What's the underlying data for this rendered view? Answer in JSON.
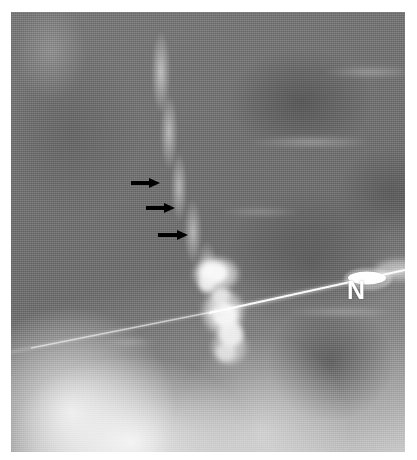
{
  "figure": {
    "kind": "radiograph",
    "modality_label": "fluoroscopic-spot-radiograph",
    "background_color": "#ffffff",
    "plate": {
      "x": 11,
      "y": 12,
      "width": 394,
      "height": 440,
      "base_color": "#6e6e6e"
    }
  },
  "annotations": {
    "arrows": [
      {
        "id": "arrow-1",
        "label": "",
        "x": 131,
        "y": 178,
        "length": 29,
        "color": "#000000",
        "direction": "right"
      },
      {
        "id": "arrow-2",
        "label": "",
        "x": 146,
        "y": 203,
        "length": 29,
        "color": "#000000",
        "direction": "right"
      },
      {
        "id": "arrow-3",
        "label": "",
        "x": 158,
        "y": 230,
        "length": 30,
        "color": "#000000",
        "direction": "right"
      }
    ],
    "letter_labels": [
      {
        "id": "needle-label",
        "text": "N",
        "x": 347,
        "y": 278,
        "color": "#ffffff",
        "font_size": 25
      }
    ]
  },
  "radiographic_features": {
    "needle": {
      "name": "needle-tract",
      "color": "#ffffff",
      "hub": {
        "cx": 357,
        "cy": 267,
        "rx": 19,
        "ry": 7
      },
      "shaft_from": {
        "x": 394,
        "y": 262
      },
      "shaft_to": {
        "x": 196,
        "y": 300
      }
    },
    "contrast_blob": {
      "name": "contrast-collection",
      "color": "#f5f5f5",
      "center": {
        "x": 220,
        "y": 300
      }
    },
    "dark_region": {
      "name": "bowel-gas-lucency",
      "center": {
        "x": 320,
        "y": 350
      }
    },
    "bright_region": {
      "name": "dense-soft-tissue",
      "center": {
        "x": 90,
        "y": 415
      }
    }
  }
}
